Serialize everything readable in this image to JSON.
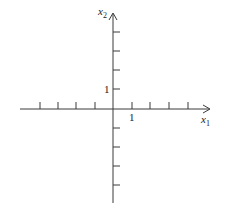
{
  "diagram": {
    "type": "coordinate-axes",
    "colors": {
      "axis": "#3a3a3a",
      "background": "#ffffff",
      "text": "#222222"
    },
    "x_axis": {
      "label_base": "x",
      "label_sub": "1",
      "unit_label": "1",
      "negative_ticks": 4,
      "positive_ticks": 4
    },
    "y_axis": {
      "label_base": "x",
      "label_sub": "2",
      "unit_label": "1",
      "negative_ticks": 4,
      "positive_ticks": 4
    }
  }
}
